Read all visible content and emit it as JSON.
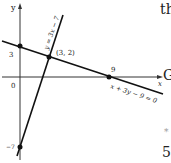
{
  "diagram": {
    "axes": {
      "x_label": "x",
      "y_label": "y",
      "origin_label": "0"
    },
    "lines": [
      {
        "equation": "y = 3x − 7"
      },
      {
        "equation": "x + 3y − 9 = 0"
      }
    ],
    "points": [
      {
        "label": "3",
        "coords": [
          0,
          3
        ]
      },
      {
        "label": "(3, 2)",
        "coords": [
          3,
          2
        ]
      },
      {
        "label": "9",
        "coords": [
          9,
          0
        ]
      },
      {
        "label": "−7",
        "coords": [
          0,
          -7
        ]
      }
    ]
  },
  "side_text": {
    "top": "th",
    "middle": "G",
    "bullet": "*",
    "bottom": "5"
  }
}
